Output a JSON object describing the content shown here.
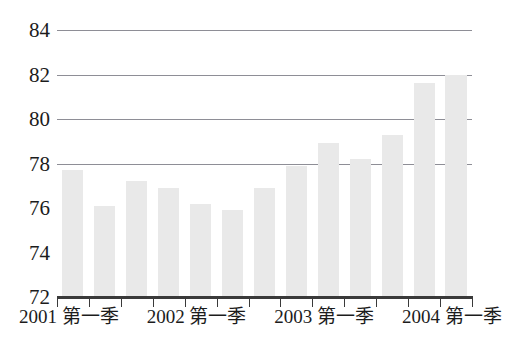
{
  "chart_data": {
    "type": "bar",
    "title": "",
    "clipped_title": "",
    "xlabel": "",
    "ylabel": "",
    "ylim": [
      72,
      84
    ],
    "ytick_labels": [
      "84",
      "82",
      "80",
      "78",
      "76",
      "74",
      "72"
    ],
    "yticks": [
      84,
      82,
      80,
      78,
      76,
      74,
      72
    ],
    "gridlines": [
      84,
      82,
      80,
      78
    ],
    "grid": true,
    "legend": "none",
    "categories": [
      "2001 第一季",
      "2001 第二季",
      "2001 第三季",
      "2001 第四季",
      "2002 第一季",
      "2002 第二季",
      "2002 第三季",
      "2002 第四季",
      "2003 第一季",
      "2003 第二季",
      "2003 第三季",
      "2003 第四季",
      "2004 第一季"
    ],
    "values": [
      77.7,
      76.1,
      77.2,
      76.9,
      76.2,
      75.9,
      76.9,
      77.9,
      78.9,
      78.2,
      79.3,
      81.6,
      82.0
    ],
    "visible_tick_labels": [
      {
        "text": "2001 第一季",
        "index": 0
      },
      {
        "text": "2002 第一季",
        "index": 4
      },
      {
        "text": "2003 第一季",
        "index": 8
      },
      {
        "text": "2004 第一季",
        "index": 12
      }
    ],
    "bar_color": "#e9e9e9",
    "gridline_color": "#8e8e96",
    "axis_color": "#3a3a3a",
    "text_color": "#1c1c1c",
    "background": "#ffffff"
  }
}
